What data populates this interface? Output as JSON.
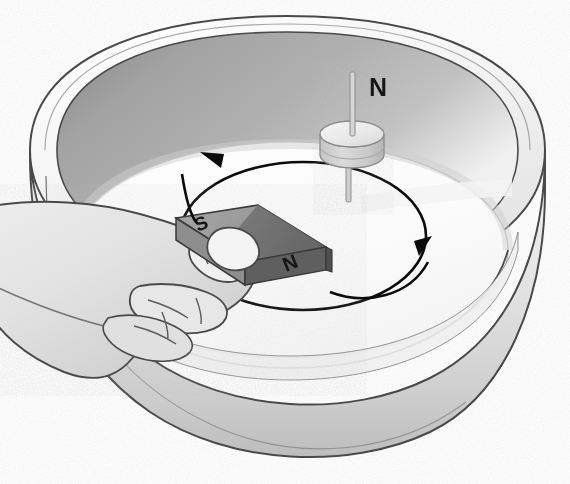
{
  "scene": {
    "title": "Bar magnet moved around a pivoted disc magnet in a bowl",
    "background_color": "#ffffff",
    "width": 570,
    "height": 484
  },
  "labels": {
    "pivot_north_label": "N",
    "bar_magnet_south_label": "S",
    "bar_magnet_north_label": "N"
  },
  "bowl": {
    "name": "bowl",
    "rim_highlight_color": "#f2f2f2",
    "outer_wall_color": "#dcdcdc",
    "inner_wall_color": "#a9a9a9",
    "inner_floor_color": "#fbfbfb",
    "outline_color": "#4a4a4a"
  },
  "pivot_magnet": {
    "name": "pivoting disc magnet",
    "disc_top_color": "#ededed",
    "disc_side_color": "#cfcfcf",
    "needle_color": "#b9b9b9",
    "needle_outline": "#8c8c8c"
  },
  "bar_magnet": {
    "name": "bar magnet held in hand",
    "south_pole_color": "#9d9d9d",
    "north_pole_color": "#6d6d6d",
    "side_color": "#5a5a5a",
    "outline_color": "#3a3a3a"
  },
  "hand": {
    "name": "hand holding magnet",
    "skin_color": "#e3e3e3",
    "shade_color": "#cfcfcf",
    "outline_color": "#4a4a4a"
  },
  "rotation_arrow": {
    "name": "circular rotation arrow",
    "color": "#0b0b0b",
    "direction": "counter-clockwise",
    "stroke_width": 2.6,
    "arrowhead_count": 2
  }
}
